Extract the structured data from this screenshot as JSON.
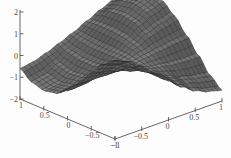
{
  "figure": {
    "title": "",
    "background_color": "#fdfdfd",
    "axis_color": "#555555",
    "surface_color": "#6e6e6e",
    "mesh_color": "#2b2b2b"
  },
  "chart_data": {
    "type": "surface",
    "title": "",
    "xlabel": "",
    "ylabel": "",
    "zlabel": "",
    "xlim": [
      -1,
      1
    ],
    "ylim": [
      -1,
      1
    ],
    "zlim": [
      -2,
      2
    ],
    "grid": false,
    "legend": null,
    "projection": "3d",
    "mesh_divisions": 26,
    "axes": [
      {
        "name": "z-axis",
        "position": "left-vertical",
        "ticks": [
          2,
          1,
          0,
          -1,
          -2
        ],
        "tick_labels": [
          "2",
          "1",
          "0",
          "−1",
          "−2"
        ]
      },
      {
        "name": "x-axis",
        "position": "bottom-left",
        "ticks": [
          1,
          0.5,
          0,
          -0.5,
          -1
        ],
        "tick_labels": [
          "1",
          "0.5",
          "0",
          "−0.5",
          "−1"
        ]
      },
      {
        "name": "y-axis",
        "position": "bottom-right",
        "ticks": [
          -1,
          -0.5,
          0,
          0.5,
          1
        ],
        "tick_labels": [
          "−1",
          "−0.5",
          "0",
          "0.5",
          "1"
        ]
      }
    ],
    "z_ticks": [
      "2",
      "1",
      "0",
      "−1",
      "−2"
    ],
    "x_ticks": [
      "1",
      "0.5",
      "0",
      "−0.5",
      "−1"
    ],
    "y_ticks": [
      "−1",
      "−0.5",
      "0",
      "0.5",
      "1"
    ],
    "surface_values": {
      "note": "z estimated from the rendered wireframe on a 9x9 sample grid; rows are y = -1 .. 1, columns are x = -1 .. 1",
      "x_samples": [
        -1,
        -0.75,
        -0.5,
        -0.25,
        0,
        0.25,
        0.5,
        0.75,
        1
      ],
      "y_samples": [
        -1,
        -0.75,
        -0.5,
        -0.25,
        0,
        0.25,
        0.5,
        0.75,
        1
      ],
      "z": [
        [
          1.6,
          1.2,
          0.55,
          -0.15,
          -0.7,
          -1.05,
          -1.15,
          -1.0,
          -0.6
        ],
        [
          1.35,
          1.0,
          0.45,
          -0.15,
          -0.65,
          -0.95,
          -1.05,
          -0.9,
          -0.5
        ],
        [
          0.9,
          0.65,
          0.25,
          -0.15,
          -0.5,
          -0.7,
          -0.75,
          -0.6,
          -0.3
        ],
        [
          0.35,
          0.25,
          0.05,
          -0.1,
          -0.25,
          -0.35,
          -0.35,
          -0.25,
          -0.05
        ],
        [
          -0.2,
          -0.15,
          -0.1,
          0.0,
          0.05,
          0.05,
          0.05,
          0.1,
          0.2
        ],
        [
          -0.7,
          -0.5,
          -0.2,
          0.1,
          0.35,
          0.5,
          0.55,
          0.55,
          0.5
        ],
        [
          -1.1,
          -0.8,
          -0.3,
          0.2,
          0.65,
          0.95,
          1.05,
          1.0,
          0.8
        ],
        [
          -1.35,
          -0.95,
          -0.35,
          0.3,
          0.85,
          1.25,
          1.4,
          1.3,
          1.05
        ],
        [
          -1.5,
          -1.05,
          -0.35,
          0.35,
          1.0,
          1.45,
          1.6,
          1.5,
          1.2
        ]
      ]
    }
  }
}
